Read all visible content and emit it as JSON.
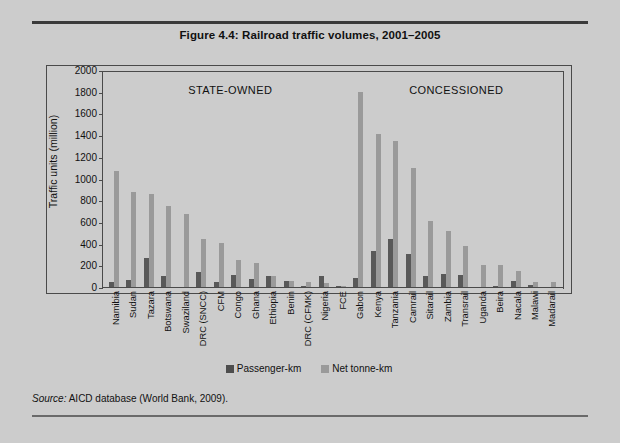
{
  "figure": {
    "title": "Figure 4.4:  Railroad traffic volumes, 2001–2005",
    "source": "Source: AICD database (World Bank, 2009)."
  },
  "legend": {
    "items": [
      {
        "label": "Passenger-km",
        "color": "#4d4d4d",
        "name": "legend-passenger-km"
      },
      {
        "label": "Net tonne-km",
        "color": "#9a9a9a",
        "name": "legend-net-tonne-km"
      }
    ]
  },
  "annotations": {
    "state_owned": "STATE-OWNED",
    "concessioned": "CONCESSIONED"
  },
  "chart_data": {
    "type": "bar",
    "title": "Figure 4.4:  Railroad traffic volumes, 2001–2005",
    "xlabel": "",
    "ylabel": "Traffic units (million)",
    "ylim": [
      0,
      2000
    ],
    "yticks": [
      0,
      200,
      400,
      600,
      800,
      1000,
      1200,
      1400,
      1600,
      1800,
      2000
    ],
    "grid": false,
    "legend_position": "bottom",
    "categories": [
      "Namibia",
      "Sudan",
      "Tazara",
      "Botswana",
      "Swaziland",
      "DRC (SNCC)",
      "CFM",
      "Congo",
      "Ghana",
      "Ethiopia",
      "Benin",
      "DRC (CFMK)",
      "Nigeria",
      "FCE",
      "Gabon",
      "Kenya",
      "Tanzania",
      "Camrail",
      "Sitarail",
      "Zambia",
      "Transrail",
      "Uganda",
      "Beira",
      "Nacala",
      "Malawi",
      "Madarail"
    ],
    "groups": [
      {
        "name": "STATE-OWNED",
        "categories": [
          "Namibia",
          "Sudan",
          "Tazara",
          "Botswana",
          "Swaziland",
          "DRC (SNCC)",
          "CFM",
          "Congo",
          "Ghana",
          "Ethiopia",
          "Benin",
          "DRC (CFMK)",
          "Nigeria",
          "FCE"
        ]
      },
      {
        "name": "CONCESSIONED",
        "categories": [
          "Gabon",
          "Kenya",
          "Tanzania",
          "Camrail",
          "Sitarail",
          "Zambia",
          "Transrail",
          "Uganda",
          "Beira",
          "Nacala",
          "Malawi",
          "Madarail"
        ]
      }
    ],
    "series": [
      {
        "name": "Passenger-km",
        "color": "#595959",
        "values": [
          50,
          65,
          265,
          105,
          0,
          140,
          50,
          110,
          70,
          100,
          60,
          10,
          100,
          5,
          80,
          330,
          440,
          300,
          105,
          120,
          110,
          0,
          10,
          55,
          20,
          0
        ]
      },
      {
        "name": "Net tonne-km",
        "color": "#9a9a9a",
        "values": [
          1070,
          880,
          855,
          750,
          675,
          440,
          410,
          250,
          225,
          100,
          60,
          45,
          40,
          10,
          1800,
          1410,
          1350,
          1100,
          610,
          515,
          380,
          200,
          200,
          150,
          50,
          45
        ]
      }
    ]
  }
}
